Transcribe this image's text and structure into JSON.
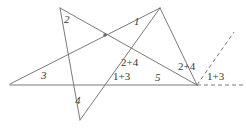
{
  "figure": {
    "width": 246,
    "height": 128,
    "stroke_color": "#6b6b6b",
    "label_color": "#3a3a3a",
    "background": "#ffffff",
    "vertices": {
      "top_left_spike": [
        60,
        8
      ],
      "top_right_spike": [
        160,
        8
      ],
      "bottom_spike": [
        80,
        120
      ],
      "left_spike": [
        10,
        84
      ],
      "right_spike": [
        197,
        85
      ]
    },
    "center_dot": [
      105,
      35
    ],
    "baseline": {
      "x1": 10,
      "y1": 85,
      "x2": 197,
      "y2": 85
    },
    "dashed_ray": {
      "x1": 197,
      "y1": 85,
      "x2": 234,
      "y2": 32
    },
    "dashed_baseline_ext": {
      "x1": 197,
      "y1": 85,
      "x2": 244,
      "y2": 85
    },
    "labels": [
      {
        "name": "angle-label-2",
        "text": "2",
        "x": 64,
        "y": 14
      },
      {
        "name": "angle-label-1",
        "text": "1",
        "x": 134,
        "y": 16
      },
      {
        "name": "angle-label-3",
        "text": "3",
        "x": 41,
        "y": 70
      },
      {
        "name": "angle-label-4",
        "text": "4",
        "x": 75,
        "y": 95
      },
      {
        "name": "angle-label-5",
        "text": "5",
        "x": 155,
        "y": 72
      },
      {
        "name": "angle-label-sum-2-4-center",
        "text": "2+4",
        "x": 121,
        "y": 57
      },
      {
        "name": "angle-label-sum-1-3-center",
        "text": "1+3",
        "x": 113,
        "y": 71
      },
      {
        "name": "angle-label-sum-2-4-right",
        "text": "2+4",
        "x": 178,
        "y": 61
      },
      {
        "name": "angle-label-sum-1-3-right",
        "text": "1+3",
        "x": 207,
        "y": 71
      }
    ]
  }
}
